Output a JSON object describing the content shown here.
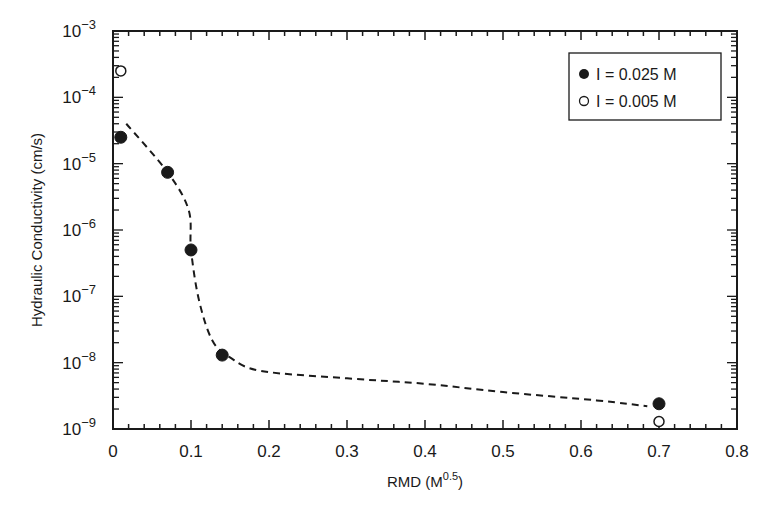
{
  "chart_data": {
    "type": "scatter",
    "title": "",
    "xlabel": "RMD (M^0.5)",
    "xlabel_main": "RMD (M",
    "xlabel_sup": "0.5",
    "xlabel_close": ")",
    "ylabel": "Hydraulic Conductivity (cm/s)",
    "xlim": [
      0,
      0.8
    ],
    "ylim": [
      1e-09,
      0.001
    ],
    "yscale": "log",
    "grid": false,
    "legend_position": "upper right",
    "x_ticks": [
      "0",
      "0.1",
      "0.2",
      "0.3",
      "0.4",
      "0.5",
      "0.6",
      "0.7",
      "0.8"
    ],
    "y_ticks": [
      {
        "base": "10",
        "exp": "-3"
      },
      {
        "base": "10",
        "exp": "-4"
      },
      {
        "base": "10",
        "exp": "-5"
      },
      {
        "base": "10",
        "exp": "-6"
      },
      {
        "base": "10",
        "exp": "-7"
      },
      {
        "base": "10",
        "exp": "-8"
      },
      {
        "base": "10",
        "exp": "-9"
      }
    ],
    "series": [
      {
        "name": "I = 0.025 M",
        "marker": "filled-circle",
        "points": [
          {
            "x": 0.01,
            "y": 2.5e-05
          },
          {
            "x": 0.07,
            "y": 7.4e-06
          },
          {
            "x": 0.1,
            "y": 5e-07
          },
          {
            "x": 0.14,
            "y": 1.3e-08
          },
          {
            "x": 0.7,
            "y": 2.4e-09
          }
        ]
      },
      {
        "name": "I = 0.005 M",
        "marker": "open-circle",
        "points": [
          {
            "x": 0.01,
            "y": 0.00025
          },
          {
            "x": 0.7,
            "y": 1.3e-09
          }
        ]
      }
    ],
    "trend_line": {
      "style": "dashed",
      "points": [
        {
          "x": 0.017,
          "y": 4e-05
        },
        {
          "x": 0.07,
          "y": 7.4e-06
        },
        {
          "x": 0.097,
          "y": 2e-06
        },
        {
          "x": 0.1,
          "y": 5e-07
        },
        {
          "x": 0.11,
          "y": 9e-08
        },
        {
          "x": 0.127,
          "y": 2.2e-08
        },
        {
          "x": 0.15,
          "y": 1.2e-08
        },
        {
          "x": 0.19,
          "y": 7.5e-09
        },
        {
          "x": 0.3,
          "y": 5.8e-09
        },
        {
          "x": 0.4,
          "y": 4.8e-09
        },
        {
          "x": 0.5,
          "y": 3.6e-09
        },
        {
          "x": 0.62,
          "y": 2.7e-09
        },
        {
          "x": 0.685,
          "y": 2.2e-09
        }
      ]
    }
  },
  "colors": {
    "ink": "#1a1a1a",
    "background": "#ffffff"
  }
}
